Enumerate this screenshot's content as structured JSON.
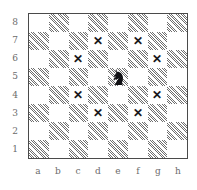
{
  "board": {
    "files": [
      "a",
      "b",
      "c",
      "d",
      "e",
      "f",
      "g",
      "h"
    ],
    "ranks": [
      "8",
      "7",
      "6",
      "5",
      "4",
      "3",
      "2",
      "1"
    ],
    "light_color": "#ffffff",
    "dark_color": "#6e6e6e",
    "border_color": "#4a4a4a",
    "label_color": "#6b6b6b",
    "mark_color": "#17171a",
    "mark_glyph": "✕",
    "piece": {
      "square": "e5",
      "type": "knight",
      "color": "black",
      "icon": "black-knight-icon"
    },
    "marked_squares": [
      "d7",
      "f7",
      "c6",
      "g6",
      "c4",
      "g4",
      "d3",
      "f3"
    ],
    "squares": [
      [
        {
          "id": "a8",
          "shade": "light",
          "mark": false
        },
        {
          "id": "b8",
          "shade": "dark",
          "mark": false
        },
        {
          "id": "c8",
          "shade": "light",
          "mark": false
        },
        {
          "id": "d8",
          "shade": "dark",
          "mark": false
        },
        {
          "id": "e8",
          "shade": "light",
          "mark": false
        },
        {
          "id": "f8",
          "shade": "dark",
          "mark": false
        },
        {
          "id": "g8",
          "shade": "light",
          "mark": false
        },
        {
          "id": "h8",
          "shade": "dark",
          "mark": false
        }
      ],
      [
        {
          "id": "a7",
          "shade": "dark",
          "mark": false
        },
        {
          "id": "b7",
          "shade": "light",
          "mark": false
        },
        {
          "id": "c7",
          "shade": "dark",
          "mark": false
        },
        {
          "id": "d7",
          "shade": "light",
          "mark": true
        },
        {
          "id": "e7",
          "shade": "dark",
          "mark": false
        },
        {
          "id": "f7",
          "shade": "light",
          "mark": true
        },
        {
          "id": "g7",
          "shade": "dark",
          "mark": false
        },
        {
          "id": "h7",
          "shade": "light",
          "mark": false
        }
      ],
      [
        {
          "id": "a6",
          "shade": "light",
          "mark": false
        },
        {
          "id": "b6",
          "shade": "dark",
          "mark": false
        },
        {
          "id": "c6",
          "shade": "light",
          "mark": true
        },
        {
          "id": "d6",
          "shade": "dark",
          "mark": false
        },
        {
          "id": "e6",
          "shade": "light",
          "mark": false
        },
        {
          "id": "f6",
          "shade": "dark",
          "mark": false
        },
        {
          "id": "g6",
          "shade": "light",
          "mark": true
        },
        {
          "id": "h6",
          "shade": "dark",
          "mark": false
        }
      ],
      [
        {
          "id": "a5",
          "shade": "dark",
          "mark": false
        },
        {
          "id": "b5",
          "shade": "light",
          "mark": false
        },
        {
          "id": "c5",
          "shade": "dark",
          "mark": false
        },
        {
          "id": "d5",
          "shade": "light",
          "mark": false
        },
        {
          "id": "e5",
          "shade": "dark",
          "mark": false,
          "piece": "black-knight"
        },
        {
          "id": "f5",
          "shade": "light",
          "mark": false
        },
        {
          "id": "g5",
          "shade": "dark",
          "mark": false
        },
        {
          "id": "h5",
          "shade": "light",
          "mark": false
        }
      ],
      [
        {
          "id": "a4",
          "shade": "light",
          "mark": false
        },
        {
          "id": "b4",
          "shade": "dark",
          "mark": false
        },
        {
          "id": "c4",
          "shade": "light",
          "mark": true
        },
        {
          "id": "d4",
          "shade": "dark",
          "mark": false
        },
        {
          "id": "e4",
          "shade": "light",
          "mark": false
        },
        {
          "id": "f4",
          "shade": "dark",
          "mark": false
        },
        {
          "id": "g4",
          "shade": "light",
          "mark": true
        },
        {
          "id": "h4",
          "shade": "dark",
          "mark": false
        }
      ],
      [
        {
          "id": "a3",
          "shade": "dark",
          "mark": false
        },
        {
          "id": "b3",
          "shade": "light",
          "mark": false
        },
        {
          "id": "c3",
          "shade": "dark",
          "mark": false
        },
        {
          "id": "d3",
          "shade": "light",
          "mark": true
        },
        {
          "id": "e3",
          "shade": "dark",
          "mark": false
        },
        {
          "id": "f3",
          "shade": "light",
          "mark": true
        },
        {
          "id": "g3",
          "shade": "dark",
          "mark": false
        },
        {
          "id": "h3",
          "shade": "light",
          "mark": false
        }
      ],
      [
        {
          "id": "a2",
          "shade": "light",
          "mark": false
        },
        {
          "id": "b2",
          "shade": "dark",
          "mark": false
        },
        {
          "id": "c2",
          "shade": "light",
          "mark": false
        },
        {
          "id": "d2",
          "shade": "dark",
          "mark": false
        },
        {
          "id": "e2",
          "shade": "light",
          "mark": false
        },
        {
          "id": "f2",
          "shade": "dark",
          "mark": false
        },
        {
          "id": "g2",
          "shade": "light",
          "mark": false
        },
        {
          "id": "h2",
          "shade": "dark",
          "mark": false
        }
      ],
      [
        {
          "id": "a1",
          "shade": "dark",
          "mark": false
        },
        {
          "id": "b1",
          "shade": "light",
          "mark": false
        },
        {
          "id": "c1",
          "shade": "dark",
          "mark": false
        },
        {
          "id": "d1",
          "shade": "light",
          "mark": false
        },
        {
          "id": "e1",
          "shade": "dark",
          "mark": false
        },
        {
          "id": "f1",
          "shade": "light",
          "mark": false
        },
        {
          "id": "g1",
          "shade": "dark",
          "mark": false
        },
        {
          "id": "h1",
          "shade": "light",
          "mark": false
        }
      ]
    ]
  }
}
